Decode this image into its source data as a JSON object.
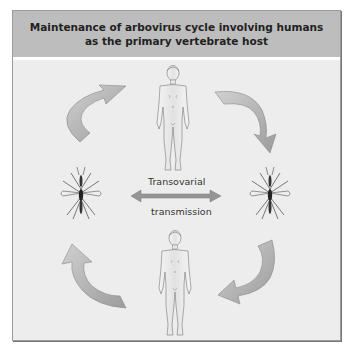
{
  "title": {
    "line1": "Maintenance of arbovirus cycle involving humans",
    "line2": "as the primary vertebrate host"
  },
  "labels": {
    "center_top": "Transovarial",
    "center_bottom": "transmission"
  },
  "nodes": [
    {
      "id": "human-top",
      "type": "human-figure"
    },
    {
      "id": "mosquito-left",
      "type": "mosquito"
    },
    {
      "id": "mosquito-right",
      "type": "mosquito"
    },
    {
      "id": "human-bottom",
      "type": "human-figure"
    }
  ],
  "edges": [
    {
      "from": "mosquito-left",
      "to": "human-top",
      "style": "curved-arrow"
    },
    {
      "from": "human-top",
      "to": "mosquito-right",
      "style": "curved-arrow"
    },
    {
      "from": "mosquito-right",
      "to": "human-bottom",
      "style": "curved-arrow"
    },
    {
      "from": "human-bottom",
      "to": "mosquito-left",
      "style": "curved-arrow"
    },
    {
      "from": "mosquito-left",
      "to": "mosquito-right",
      "style": "double-headed-arrow",
      "label": "Transovarial transmission"
    }
  ],
  "colors": {
    "header_bg": "#bdbdbd",
    "panel_bg": "#ededed",
    "arrow_fill": "#a8a8a8",
    "double_arrow": "#8f8f8f"
  }
}
